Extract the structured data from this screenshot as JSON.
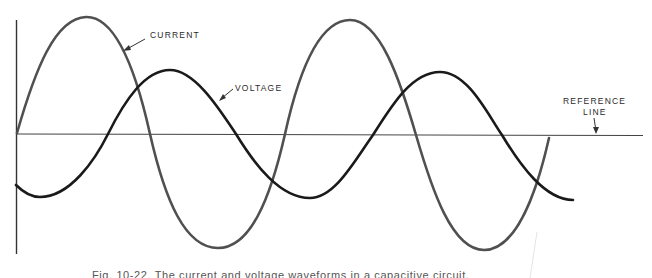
{
  "diagram": {
    "type": "waveform",
    "labels": {
      "current": "CURRENT",
      "voltage": "VOLTAGE",
      "reference_line_1": "REFERENCE",
      "reference_line_2": "LINE"
    },
    "caption": "Fig. 10-22. The current and voltage waveforms in a capacitive circuit.",
    "colors": {
      "current_stroke": "#555555",
      "voltage_stroke": "#1a1a1a",
      "axis_stroke": "#333333",
      "background": "#ffffff"
    }
  }
}
